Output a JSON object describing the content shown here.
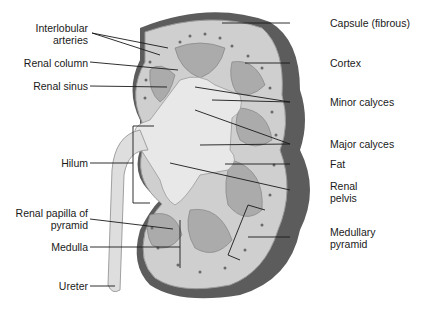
{
  "diagram": {
    "colors": {
      "capsule": "#5a5a5a",
      "cortex": "#c9c9c9",
      "medulla": "#a8a8a8",
      "sinus": "#e6e6e6",
      "ureter": "#dcdcdc",
      "line": "#1a1a1a"
    },
    "labels_left": [
      {
        "id": "interlobular-arteries",
        "line1": "Interlobular",
        "line2": "arteries"
      },
      {
        "id": "renal-column",
        "line1": "Renal column"
      },
      {
        "id": "renal-sinus",
        "line1": "Renal sinus"
      },
      {
        "id": "hilum",
        "line1": "Hilum"
      },
      {
        "id": "renal-papilla",
        "line1": "Renal papilla of",
        "line2": "pyramid"
      },
      {
        "id": "medulla",
        "line1": "Medulla"
      },
      {
        "id": "ureter",
        "line1": "Ureter"
      }
    ],
    "labels_right": [
      {
        "id": "capsule",
        "line1": "Capsule (fibrous)"
      },
      {
        "id": "cortex",
        "line1": "Cortex"
      },
      {
        "id": "minor-calyces",
        "line1": "Minor calyces"
      },
      {
        "id": "major-calyces",
        "line1": "Major calyces"
      },
      {
        "id": "fat",
        "line1": "Fat"
      },
      {
        "id": "renal-pelvis",
        "line1": "Renal",
        "line2": "pelvis"
      },
      {
        "id": "medullary-pyramid",
        "line1": "Medullary",
        "line2": "pyramid"
      }
    ]
  }
}
